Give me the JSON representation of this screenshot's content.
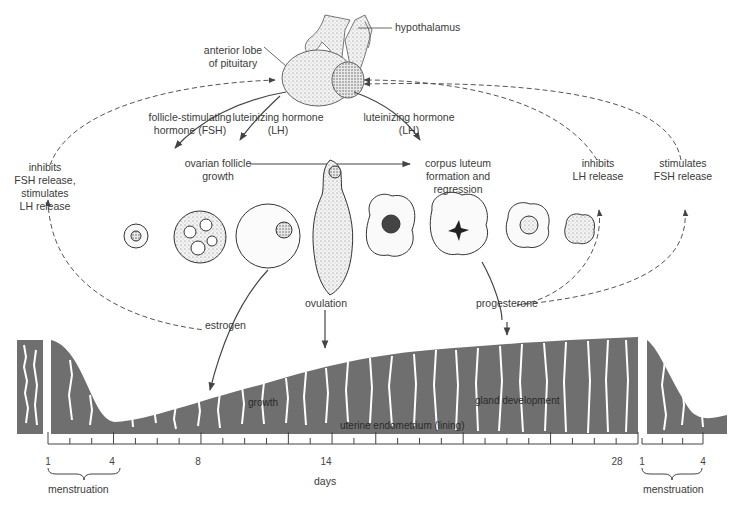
{
  "labels": {
    "hypothalamus": "hypothalamus",
    "anterior_lobe_1": "anterior lobe",
    "anterior_lobe_2": "of pituitary",
    "fsh_1": "follicle-stimulating",
    "fsh_2": "hormone (FSH)",
    "lh_left_1": "luteinizing hormone",
    "lh_left_2": "(LH)",
    "lh_right_1": "luteinizing hormone",
    "lh_right_2": "(LH)",
    "ovarian_1": "ovarian follicle",
    "ovarian_2": "growth",
    "corpus_1": "corpus luteum",
    "corpus_2": "formation and",
    "corpus_3": "regression",
    "inhibits_fsh_1": "inhibits",
    "inhibits_fsh_2": "FSH release,",
    "inhibits_fsh_3": "stimulates",
    "inhibits_fsh_4": "LH release",
    "inhibits_lh_1": "inhibits",
    "inhibits_lh_2": "LH release",
    "stimulates_fsh_1": "stimulates",
    "stimulates_fsh_2": "FSH release",
    "estrogen": "estrogen",
    "ovulation": "ovulation",
    "progesterone": "progesterone",
    "growth": "growth",
    "gland_development": "gland development",
    "uterine_endometrium": "uterine endometrium (lining)"
  },
  "axis": {
    "title": "days",
    "ticks": [
      {
        "label": "1",
        "x": 48
      },
      {
        "label": "4",
        "x": 112
      },
      {
        "label": "8",
        "x": 198
      },
      {
        "label": "14",
        "x": 326
      },
      {
        "label": "28",
        "x": 617
      },
      {
        "label": "1",
        "x": 642
      },
      {
        "label": "4",
        "x": 703
      }
    ],
    "brace_left_label": "menstruation",
    "brace_right_label": "menstruation"
  },
  "colors": {
    "endometrium": "#6f6f6f",
    "line": "#4a4a4a",
    "background": "#ffffff",
    "stipple": "#d8d8d8"
  }
}
